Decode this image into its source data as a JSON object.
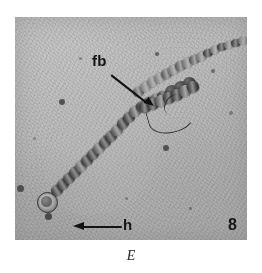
{
  "figure": {
    "panel_label": "E",
    "plate_number": "8",
    "annotations": [
      {
        "key": "fb",
        "label": "fb",
        "meaning": "false-branch",
        "arrow": "diagonal-down-right"
      },
      {
        "key": "h",
        "label": "h",
        "meaning": "heterocyst",
        "arrow": "left"
      }
    ],
    "image": {
      "type": "light-micrograph",
      "subject": "filamentous cyanobacterium trichome",
      "background_color": "#b6b6b6",
      "detail_color": "#242424",
      "page_color": "#ffffff"
    }
  }
}
